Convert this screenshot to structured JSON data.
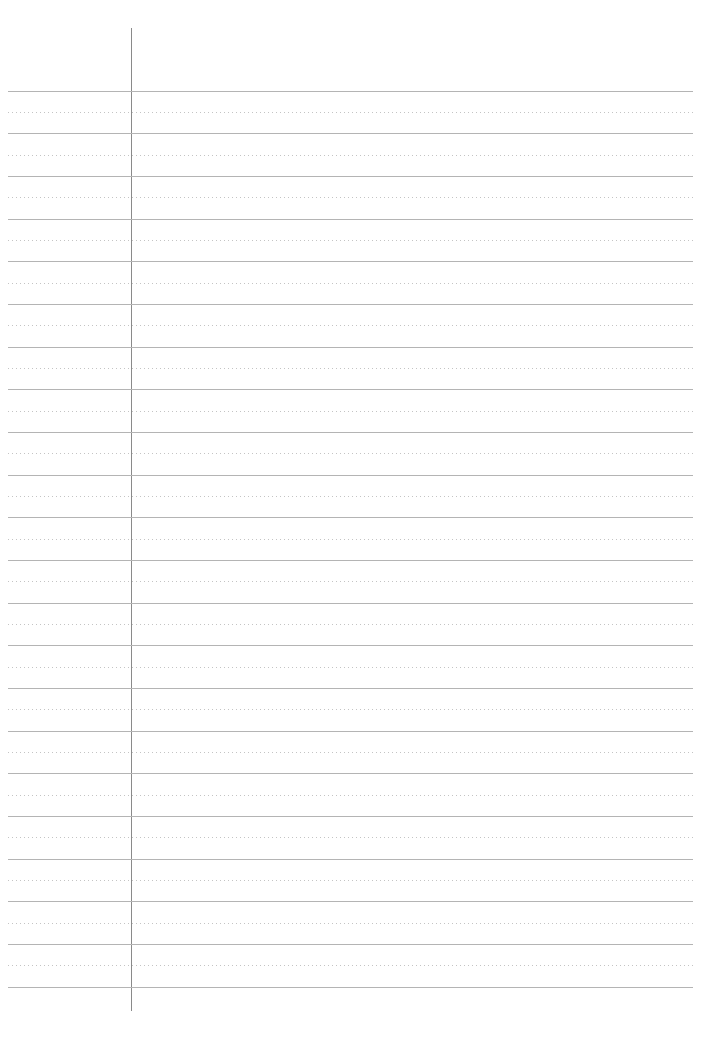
{
  "document": {
    "type": "lined-paper",
    "size": {
      "width": 716,
      "height": 1054
    },
    "background_color": "#ffffff",
    "margin_line": {
      "x": 131,
      "top": 28,
      "bottom": 1011,
      "color": "#8a8a8a"
    },
    "rules": {
      "left": 8,
      "right": 693,
      "first_solid_y": 90.7,
      "spacing": 42.67,
      "solid_count": 22,
      "dotted_count": 21,
      "solid_color": "#b4b4b4",
      "dotted_color": "#c4c4c4",
      "dot_pitch": 4
    }
  }
}
